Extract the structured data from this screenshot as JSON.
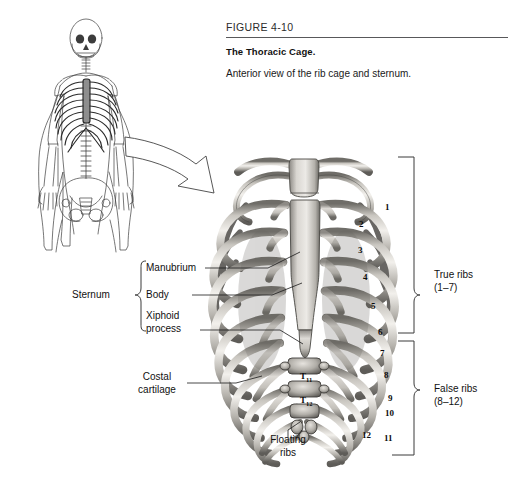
{
  "figure": {
    "number": "FIGURE 4-10",
    "title": "The Thoracic Cage.",
    "caption": "Anterior view of the rib cage and sternum."
  },
  "labels": {
    "sternum": "Sternum",
    "manubrium": "Manubrium",
    "body": "Body",
    "xiphoid_process": "Xiphoid\nprocess",
    "costal_cartilage": "Costal\ncartilage",
    "floating_ribs": "Floating\nribs",
    "true_ribs": "True ribs\n(1–7)",
    "false_ribs": "False ribs\n(8–12)"
  },
  "rib_numbers": [
    {
      "n": "1",
      "x": 385,
      "y": 202
    },
    {
      "n": "2",
      "x": 359,
      "y": 219
    },
    {
      "n": "3",
      "x": 358,
      "y": 245
    },
    {
      "n": "4",
      "x": 363,
      "y": 272
    },
    {
      "n": "5",
      "x": 371,
      "y": 301
    },
    {
      "n": "6",
      "x": 378,
      "y": 327
    },
    {
      "n": "7",
      "x": 380,
      "y": 348
    },
    {
      "n": "8",
      "x": 384,
      "y": 370
    },
    {
      "n": "9",
      "x": 388,
      "y": 393
    },
    {
      "n": "10",
      "x": 385,
      "y": 408
    },
    {
      "n": "11",
      "x": 384,
      "y": 433
    },
    {
      "n": "12",
      "x": 362,
      "y": 430
    }
  ],
  "vertebrae": [
    {
      "label": "T",
      "sub": "11",
      "x": 300,
      "y": 371
    },
    {
      "label": "T",
      "sub": "12",
      "x": 300,
      "y": 395
    }
  ],
  "colors": {
    "rule": "#58585a",
    "bracket": "#3a3a3a",
    "leader": "#1a1a1a",
    "bone_light": "#e8e6e1",
    "bone_mid": "#b9b6b0",
    "bone_dark": "#7c7a75",
    "bone_shadow": "#4a4945",
    "skeleton_line": "#3c3c3c",
    "highlight_gray": "#8e8e8e",
    "background": "#ffffff"
  }
}
